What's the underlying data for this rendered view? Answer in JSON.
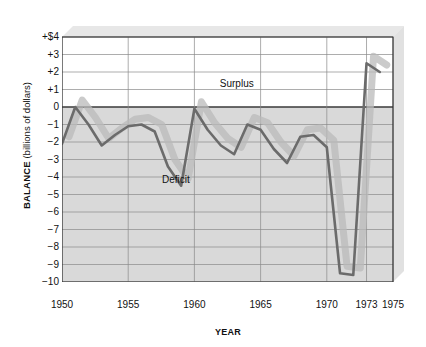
{
  "axes": {
    "ylabel_strong": "BALANCE",
    "ylabel_soft": " (billions of dollars)",
    "xlabel": "YEAR"
  },
  "annotations": {
    "surplus": "Surplus",
    "deficit": "Deficit"
  },
  "colors": {
    "line": "#6b6b6b",
    "fill": "#b9b9b9",
    "shadow": "#c9c9c9",
    "grid": "#8a8a8a",
    "axis": "#3a3a3a",
    "text": "#111111",
    "background": "#ffffff"
  },
  "chart_data": {
    "type": "line",
    "title": "",
    "xlabel": "YEAR",
    "ylabel": "BALANCE (billions of dollars)",
    "xlim": [
      1950,
      1975
    ],
    "ylim": [
      -10,
      4
    ],
    "grid": true,
    "legend": "none",
    "ytick_labels": [
      "+$4",
      "+3",
      "+2",
      "+1",
      "0",
      "-1",
      "-2",
      "-3",
      "-4",
      "-5",
      "-6",
      "-7",
      "-8",
      "-9",
      "-10"
    ],
    "ytick_values": [
      4,
      3,
      2,
      1,
      0,
      -1,
      -2,
      -3,
      -4,
      -5,
      -6,
      -7,
      -8,
      -9,
      -10
    ],
    "xtick_labels": [
      "1950",
      "1955",
      "1960",
      "1965",
      "1970",
      "1973",
      "1975"
    ],
    "xtick_values": [
      1950,
      1955,
      1960,
      1965,
      1970,
      1973,
      1975
    ],
    "annotations": [
      {
        "text": "Surplus",
        "x": 1963.2,
        "y": 1.15
      },
      {
        "text": "Deficit",
        "x": 1958.6,
        "y": -4.35
      }
    ],
    "series": [
      {
        "name": "U.S. balance of payments",
        "x": [
          1950,
          1951,
          1952,
          1953,
          1954,
          1955,
          1956,
          1957,
          1958,
          1959,
          1960,
          1961,
          1962,
          1963,
          1964,
          1965,
          1966,
          1967,
          1968,
          1969,
          1970,
          1971,
          1972,
          1973,
          1974
        ],
        "values": [
          -2.1,
          0.0,
          -1.0,
          -2.2,
          -1.6,
          -1.1,
          -1.0,
          -1.4,
          -3.4,
          -4.5,
          -0.1,
          -1.3,
          -2.2,
          -2.7,
          -1.0,
          -1.3,
          -2.4,
          -3.2,
          -1.7,
          -1.6,
          -2.3,
          -9.5,
          -9.6,
          2.5,
          2.0
        ]
      }
    ]
  }
}
